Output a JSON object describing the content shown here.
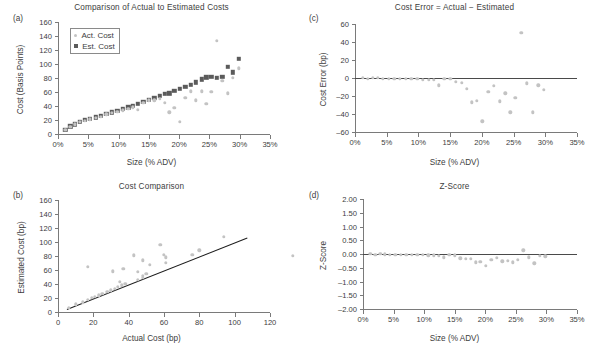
{
  "figure": {
    "panels": [
      "a",
      "b",
      "c",
      "d"
    ]
  },
  "chart_data": [
    {
      "panel": "a",
      "type": "scatter",
      "title": "Comparison of Actual to Estimated Costs",
      "xlabel": "Size (% ADV)",
      "ylabel": "Cost (Basis Points)",
      "xlim": [
        0,
        35
      ],
      "ylim": [
        0,
        160
      ],
      "xticks": [
        0,
        5,
        10,
        15,
        20,
        25,
        30,
        35
      ],
      "xtick_labels": [
        "0%",
        "5%",
        "10%",
        "15%",
        "20%",
        "25%",
        "30%",
        "35%"
      ],
      "yticks": [
        0,
        20,
        40,
        60,
        80,
        100,
        120,
        140,
        160
      ],
      "ytick_labels": [
        "0",
        "20",
        "40",
        "60",
        "80",
        "100",
        "120",
        "140",
        "160"
      ],
      "grid": false,
      "legend_position": "upper-left",
      "legend": [
        "Act. Cost",
        "Est. Cost"
      ],
      "colors": {
        "act": "#c3c3c3",
        "est": "#5b5b5b"
      },
      "series": [
        {
          "name": "Est. Cost",
          "marker": "square",
          "x": [
            1.2,
            2.0,
            2.8,
            3.6,
            4.4,
            5.3,
            6.2,
            7.1,
            8.0,
            8.9,
            9.8,
            10.7,
            11.6,
            12.4,
            13.2,
            14.1,
            15.0,
            15.9,
            16.8,
            17.6,
            18.4,
            19.2,
            20.1,
            21.0,
            21.9,
            22.8,
            23.7,
            24.5,
            25.3,
            26.2,
            27.1,
            28.0,
            28.9,
            29.8
          ],
          "y": [
            6,
            11,
            14,
            17,
            20,
            22,
            24,
            26,
            29,
            31,
            33,
            36,
            38,
            40,
            43,
            46,
            49,
            52,
            55,
            57,
            58,
            62,
            65,
            67,
            70,
            74,
            78,
            81,
            82,
            80,
            82,
            96,
            88,
            107
          ]
        },
        {
          "name": "Act. Cost",
          "marker": "circle",
          "x": [
            1.2,
            2.0,
            2.8,
            3.6,
            4.4,
            5.3,
            6.2,
            7.1,
            8.0,
            8.9,
            9.8,
            10.7,
            11.6,
            12.4,
            13.2,
            14.1,
            15.0,
            15.9,
            16.8,
            17.6,
            18.4,
            19.2,
            20.1,
            21.0,
            21.9,
            22.8,
            23.7,
            24.5,
            25.3,
            26.2,
            27.1,
            28.0,
            28.9,
            29.8
          ],
          "y": [
            6,
            10,
            14,
            17,
            19,
            21,
            23,
            25,
            28,
            30,
            32,
            34,
            36,
            38,
            35,
            45,
            48,
            48,
            50,
            45,
            31,
            37,
            17,
            52,
            61,
            48,
            61,
            43,
            60,
            133,
            76,
            58,
            80,
            94
          ]
        }
      ]
    },
    {
      "panel": "b",
      "type": "scatter",
      "title": "Cost Comparison",
      "xlabel": "Actual Cost (bp)",
      "ylabel": "Estimated Cost (bp)",
      "xlim": [
        0,
        120
      ],
      "ylim": [
        0,
        160
      ],
      "xticks": [
        0,
        20,
        40,
        60,
        80,
        100,
        120
      ],
      "xtick_labels": [
        "0",
        "20",
        "40",
        "60",
        "80",
        "100",
        "120"
      ],
      "yticks": [
        0,
        20,
        40,
        60,
        80,
        100,
        120,
        140,
        160
      ],
      "ytick_labels": [
        "0",
        "20",
        "40",
        "60",
        "80",
        "100",
        "120",
        "140",
        "160"
      ],
      "grid": false,
      "reference_line": {
        "name": "y = x",
        "x": [
          5,
          107
        ],
        "y": [
          5,
          107
        ],
        "color": "#1d1d1d"
      },
      "colors": {
        "points": "#c3c3c3"
      },
      "series": [
        {
          "name": "Estimated vs Actual",
          "marker": "circle",
          "x": [
            6,
            10,
            14,
            17,
            19,
            21,
            23,
            25,
            28,
            30,
            32,
            34,
            36,
            38,
            35,
            45,
            48,
            48,
            50,
            45,
            31,
            37,
            17,
            52,
            61,
            48,
            61,
            43,
            60,
            133,
            76,
            58,
            80,
            94
          ],
          "y": [
            6,
            11,
            14,
            17,
            20,
            22,
            24,
            26,
            29,
            31,
            33,
            36,
            38,
            40,
            43,
            46,
            49,
            52,
            55,
            57,
            58,
            62,
            65,
            67,
            70,
            74,
            78,
            81,
            82,
            80,
            82,
            96,
            88,
            107
          ]
        }
      ]
    },
    {
      "panel": "c",
      "type": "scatter",
      "title": "Cost Error = Actual − Estimated",
      "xlabel": "Size (% ADV)",
      "ylabel": "Cost Error (bp)",
      "xlim": [
        0,
        35
      ],
      "ylim": [
        -60,
        60
      ],
      "xticks": [
        0,
        5,
        10,
        15,
        20,
        25,
        30,
        35
      ],
      "xtick_labels": [
        "0%",
        "5%",
        "10%",
        "15%",
        "20%",
        "25%",
        "30%",
        "35%"
      ],
      "yticks": [
        -60,
        -40,
        -20,
        0,
        20,
        40,
        60
      ],
      "ytick_labels": [
        "–60",
        "–40",
        "–20",
        "0",
        "20",
        "40",
        "60"
      ],
      "grid": false,
      "zero_line": true,
      "colors": {
        "points": "#c3c3c3"
      },
      "series": [
        {
          "name": "Cost Error",
          "marker": "circle",
          "x": [
            1.2,
            2.0,
            2.8,
            3.6,
            4.4,
            5.3,
            6.2,
            7.1,
            8.0,
            8.9,
            9.8,
            10.7,
            11.6,
            12.4,
            13.2,
            14.1,
            15.0,
            15.9,
            16.8,
            17.6,
            18.4,
            19.2,
            20.1,
            21.0,
            21.9,
            22.8,
            23.7,
            24.5,
            25.3,
            26.2,
            27.1,
            28.0,
            28.9,
            29.8
          ],
          "y": [
            0,
            -1,
            0,
            0,
            -1,
            -1,
            -1,
            -1,
            -1,
            -1,
            -1,
            -2,
            -2,
            -2,
            -8,
            -1,
            -1,
            -4,
            -5,
            -12,
            -27,
            -25,
            -48,
            -15,
            -9,
            -26,
            -17,
            -38,
            -22,
            50,
            -6,
            -38,
            -8,
            -13
          ]
        }
      ]
    },
    {
      "panel": "d",
      "type": "scatter",
      "title": "Z-Score",
      "xlabel": "Size (% ADV)",
      "ylabel": "Z-Score",
      "xlim": [
        0,
        35
      ],
      "ylim": [
        -2.0,
        2.0
      ],
      "xticks": [
        0,
        5,
        10,
        15,
        20,
        25,
        30,
        35
      ],
      "xtick_labels": [
        "0%",
        "5%",
        "10%",
        "15%",
        "20%",
        "25%",
        "30%",
        "35%"
      ],
      "yticks": [
        -2.0,
        -1.5,
        -1.0,
        -0.5,
        0.0,
        0.5,
        1.0,
        1.5,
        2.0
      ],
      "ytick_labels": [
        "–2.00",
        "–1.50",
        "–1.00",
        "–0.50",
        "0.00",
        "0.50",
        "1.00",
        "1.50",
        "2.00"
      ],
      "grid": false,
      "zero_line": true,
      "colors": {
        "points": "#c3c3c3"
      },
      "series": [
        {
          "name": "Z-Score",
          "marker": "circle",
          "x": [
            1.2,
            2.0,
            2.8,
            3.6,
            4.4,
            5.3,
            6.2,
            7.1,
            8.0,
            8.9,
            9.8,
            10.7,
            11.6,
            12.4,
            13.2,
            14.1,
            15.0,
            15.9,
            16.8,
            17.6,
            18.4,
            19.2,
            20.1,
            21.0,
            21.9,
            22.8,
            23.7,
            24.5,
            25.3,
            26.2,
            27.1,
            28.0,
            28.9,
            29.8
          ],
          "y": [
            0.0,
            -0.02,
            0.0,
            -0.01,
            -0.02,
            -0.02,
            -0.02,
            -0.02,
            -0.03,
            -0.03,
            -0.04,
            -0.05,
            -0.05,
            -0.06,
            -0.12,
            -0.04,
            -0.05,
            -0.15,
            -0.17,
            -0.18,
            -0.3,
            -0.28,
            -0.44,
            -0.2,
            -0.13,
            -0.27,
            -0.25,
            -0.3,
            -0.22,
            0.14,
            -0.12,
            -0.34,
            -0.06,
            -0.08
          ]
        }
      ]
    }
  ]
}
